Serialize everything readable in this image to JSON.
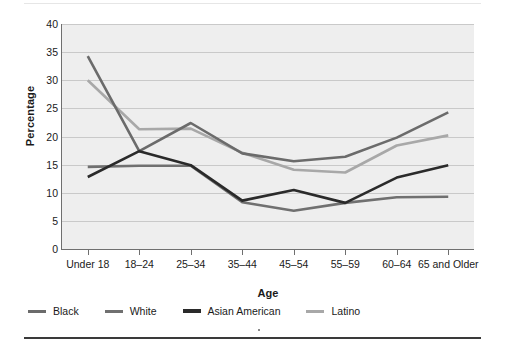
{
  "chart_data": {
    "type": "line",
    "title": "",
    "subtitle": "",
    "xlabel": "Age",
    "ylabel": "Percentage",
    "categories": [
      "Under 18",
      "18–24",
      "25–34",
      "35–44",
      "45–54",
      "55–59",
      "60–64",
      "65 and Older"
    ],
    "ylim": [
      0,
      40
    ],
    "ytick_labels": [
      "0",
      "5",
      "10",
      "15",
      "20",
      "25",
      "30",
      "35",
      "40"
    ],
    "ytick_values": [
      0,
      5,
      10,
      15,
      20,
      25,
      30,
      35,
      40
    ],
    "grid": true,
    "legend_position": "below",
    "series": [
      {
        "name": "Black",
        "color": "#6b6b6b",
        "values": [
          34.3,
          17.4,
          22.4,
          17.0,
          15.6,
          16.4,
          19.8,
          24.3
        ]
      },
      {
        "name": "White",
        "color": "#707070",
        "values": [
          14.6,
          14.8,
          14.8,
          8.3,
          6.8,
          8.2,
          9.2,
          9.3
        ]
      },
      {
        "name": "Asian American",
        "color": "#2a2a2a",
        "values": [
          12.8,
          17.4,
          14.9,
          8.6,
          10.5,
          8.2,
          12.7,
          14.9
        ]
      },
      {
        "name": "Latino",
        "color": "#a8a8a8",
        "values": [
          30.0,
          21.3,
          21.4,
          17.1,
          14.1,
          13.6,
          18.4,
          20.2
        ]
      }
    ]
  },
  "figure": {
    "plot_background": "#eeeeee",
    "grid_color": "#c9c9c9",
    "axis_color": "#6f6f6f",
    "top_rule_color": "#e6e6e6",
    "bottom_rule_color": "#3a3a3a"
  }
}
